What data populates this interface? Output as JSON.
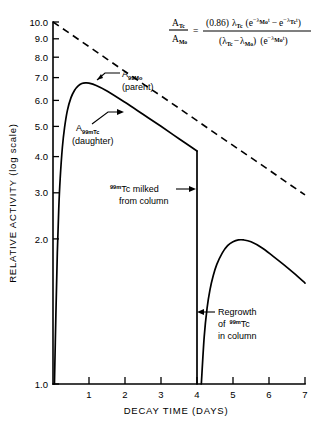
{
  "chart_data": {
    "type": "line",
    "title": "",
    "xlabel": "DECAY TIME (DAYS)",
    "ylabel": "RELATIVE ACTIVITY (log scale)",
    "yscale": "log",
    "xlim": [
      0,
      7
    ],
    "ylim": [
      1.0,
      10.0
    ],
    "grid": false,
    "legend": "none",
    "xticks": [
      "1",
      "2",
      "3",
      "4",
      "5",
      "6",
      "7"
    ],
    "xtick_values": [
      1,
      2,
      3,
      4,
      5,
      6,
      7
    ],
    "yticks": [
      "1.0",
      "2.0",
      "3.0",
      "4.0",
      "5.0",
      "6.0",
      "7.0",
      "8.0",
      "9.0",
      "10.0"
    ],
    "ytick_values": [
      1.0,
      2.0,
      3.0,
      4.0,
      5.0,
      6.0,
      7.0,
      8.0,
      9.0,
      10.0
    ],
    "series": [
      {
        "name": "A 99Mo (parent)",
        "style": "dashed",
        "points": [
          [
            0.0,
            10.0
          ],
          [
            0.5,
            9.25
          ],
          [
            1.0,
            8.55
          ],
          [
            1.5,
            7.9
          ],
          [
            2.0,
            7.3
          ],
          [
            2.5,
            6.75
          ],
          [
            3.0,
            6.25
          ],
          [
            3.5,
            5.78
          ],
          [
            4.0,
            5.34
          ],
          [
            4.5,
            4.93
          ],
          [
            5.0,
            4.56
          ],
          [
            5.5,
            4.22
          ],
          [
            6.0,
            3.9
          ],
          [
            6.5,
            3.6
          ],
          [
            7.0,
            3.33
          ]
        ]
      },
      {
        "name": "A 99mTc (daughter)",
        "style": "solid",
        "segment_1": [
          [
            0.04,
            1.0
          ],
          [
            0.08,
            1.55
          ],
          [
            0.12,
            2.3
          ],
          [
            0.16,
            3.05
          ],
          [
            0.2,
            3.7
          ],
          [
            0.26,
            4.5
          ],
          [
            0.32,
            5.1
          ],
          [
            0.4,
            5.7
          ],
          [
            0.5,
            6.18
          ],
          [
            0.6,
            6.48
          ],
          [
            0.7,
            6.66
          ],
          [
            0.8,
            6.76
          ],
          [
            0.9,
            6.79
          ],
          [
            1.0,
            6.78
          ],
          [
            1.2,
            6.68
          ],
          [
            1.5,
            6.45
          ],
          [
            2.0,
            6.0
          ],
          [
            2.5,
            5.56
          ],
          [
            3.0,
            5.15
          ],
          [
            3.5,
            4.76
          ],
          [
            4.0,
            4.4
          ]
        ],
        "segment_milking_drop": [
          [
            4.0,
            4.4
          ],
          [
            4.0,
            1.0
          ]
        ],
        "segment_2": [
          [
            4.12,
            1.0
          ],
          [
            4.2,
            1.35
          ],
          [
            4.28,
            1.62
          ],
          [
            4.36,
            1.82
          ],
          [
            4.45,
            1.99
          ],
          [
            4.55,
            2.14
          ],
          [
            4.7,
            2.3
          ],
          [
            4.85,
            2.41
          ],
          [
            5.0,
            2.47
          ],
          [
            5.15,
            2.5
          ],
          [
            5.3,
            2.5
          ],
          [
            5.5,
            2.47
          ],
          [
            5.8,
            2.38
          ],
          [
            6.1,
            2.26
          ],
          [
            6.4,
            2.14
          ],
          [
            6.7,
            2.02
          ],
          [
            7.0,
            1.9
          ]
        ]
      }
    ],
    "annotations": [
      {
        "id": "parent-label",
        "text_line1": "A",
        "sub1": "99",
        "sub2": "Mo",
        "text_line2": "(parent)",
        "target_series": "A 99Mo (parent)"
      },
      {
        "id": "daughter-label",
        "text_line1": "A",
        "sub1": "99m",
        "sub2": "Tc",
        "text_line2": "(daughter)",
        "target_series": "A 99mTc (daughter)"
      },
      {
        "id": "milked-label",
        "sup": "99m",
        "text_line1": "Tc milked",
        "text_line2": "from column",
        "at_x": 4.0
      },
      {
        "id": "regrowth-label",
        "text_line1": "Regrowth",
        "text_line2_a": "of",
        "sup": "99m",
        "text_line2_b": "Tc",
        "text_line3": "in column",
        "at_x": 4.15
      }
    ]
  },
  "equation": {
    "num_left": "A",
    "num_left_sub": "Tc",
    "den_left": "A",
    "den_left_sub": "Mo",
    "equals": "=",
    "numerator": {
      "coef": "(0.86)",
      "lambda": "λ",
      "lambda_sub": "Tc",
      "open": "(e",
      "sup1_minus": "−",
      "sup1_lambda": "λ",
      "sup1_sub": "Mo",
      "sup1_t": "t",
      "minus": "−",
      "e2": "e",
      "sup2_minus": "−",
      "sup2_lambda": "λ",
      "sup2_sub": "Tc",
      "sup2_t": "t",
      "close": ")"
    },
    "denominator": {
      "open1": "(",
      "lambda1": "λ",
      "lambda1_sub": "Tc",
      "minus": "−",
      "lambda2": "λ",
      "lambda2_sub": "Mo",
      "close1": ")",
      "open2": "(e",
      "sup_minus": "−",
      "sup_lambda": "λ",
      "sup_sub": "Mo",
      "sup_t": "t",
      "close2": ")"
    }
  },
  "colors": {
    "ink": "#000000",
    "background": "#ffffff"
  }
}
